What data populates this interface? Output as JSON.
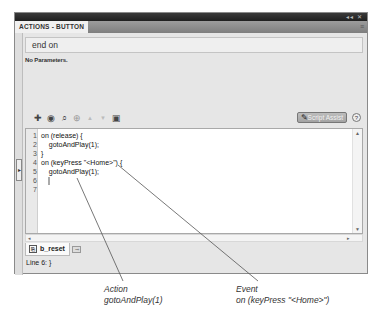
{
  "panel": {
    "title": "ACTIONS - BUTTON",
    "window_controls": "◂◂ ✕",
    "panel_menu_icon": "≡",
    "selector_value": "end on",
    "params_text": "No Parameters."
  },
  "toolbar": {
    "icons": [
      {
        "name": "add-action-icon",
        "glyph": "✚"
      },
      {
        "name": "insert-target-path-icon",
        "glyph": "◉"
      },
      {
        "name": "find-icon",
        "glyph": "⌕"
      },
      {
        "name": "insert-target-icon",
        "glyph": "⊕"
      },
      {
        "name": "move-up-icon",
        "glyph": "▲"
      },
      {
        "name": "move-down-icon",
        "glyph": "▼"
      },
      {
        "name": "code-hint-icon",
        "glyph": "▣"
      }
    ],
    "script_assist_label": "Script Assist",
    "help_glyph": "?"
  },
  "editor": {
    "lines": [
      {
        "num": "1",
        "text": "on (release) {"
      },
      {
        "num": "2",
        "text": "    gotoAndPlay(1);"
      },
      {
        "num": "3",
        "text": "}"
      },
      {
        "num": "4",
        "text": "on (keyPress \"<Home>\") {"
      },
      {
        "num": "5",
        "text": "    gotoAndPlay(1);"
      },
      {
        "num": "6",
        "text": ""
      },
      {
        "num": "7",
        "text": ""
      }
    ],
    "caret_line": 6
  },
  "file_tab": {
    "label": "b_reset",
    "pin_glyph": "⊸"
  },
  "status": {
    "text": "Line 6: }"
  },
  "callouts": [
    {
      "title": "Action",
      "detail": "gotoAndPlay(1)"
    },
    {
      "title": "Event",
      "detail": "on (keyPress \"<Home>\")"
    }
  ],
  "colors": {
    "panel_bg": "#e6e6e6",
    "titlebar": "#2a2a2a",
    "tabstrip": "#8c8c8c",
    "editor_bg": "#ffffff",
    "callout_line": "#555555"
  }
}
